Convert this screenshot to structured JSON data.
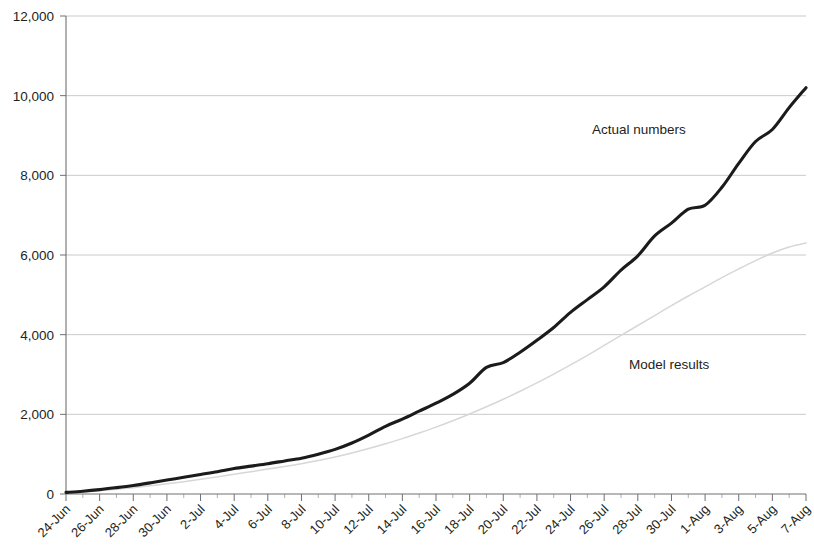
{
  "chart_data": {
    "type": "line",
    "title": "",
    "xlabel": "",
    "ylabel": "",
    "ylim": [
      0,
      12000
    ],
    "y_ticks": [
      0,
      2000,
      4000,
      6000,
      8000,
      10000,
      12000
    ],
    "y_tick_labels": [
      "0",
      "2,000",
      "4,000",
      "6,000",
      "8,000",
      "10,000",
      "12,000"
    ],
    "grid": true,
    "legend_position": "inline-annotations",
    "x": [
      "24-Jun",
      "25-Jun",
      "26-Jun",
      "27-Jun",
      "28-Jun",
      "29-Jun",
      "30-Jun",
      "1-Jul",
      "2-Jul",
      "3-Jul",
      "4-Jul",
      "5-Jul",
      "6-Jul",
      "7-Jul",
      "8-Jul",
      "9-Jul",
      "10-Jul",
      "11-Jul",
      "12-Jul",
      "13-Jul",
      "14-Jul",
      "15-Jul",
      "16-Jul",
      "17-Jul",
      "18-Jul",
      "19-Jul",
      "20-Jul",
      "21-Jul",
      "22-Jul",
      "23-Jul",
      "24-Jul",
      "25-Jul",
      "26-Jul",
      "27-Jul",
      "28-Jul",
      "29-Jul",
      "30-Jul",
      "31-Jul",
      "1-Aug",
      "2-Aug",
      "3-Aug",
      "4-Aug",
      "5-Aug",
      "6-Aug",
      "7-Aug"
    ],
    "x_tick_labels": [
      "24-Jun",
      "26-Jun",
      "28-Jun",
      "30-Jun",
      "2-Jul",
      "4-Jul",
      "6-Jul",
      "8-Jul",
      "10-Jul",
      "12-Jul",
      "14-Jul",
      "16-Jul",
      "18-Jul",
      "20-Jul",
      "22-Jul",
      "24-Jul",
      "26-Jul",
      "28-Jul",
      "30-Jul",
      "1-Aug",
      "3-Aug",
      "5-Aug",
      "7-Aug"
    ],
    "series": [
      {
        "name": "Actual numbers",
        "color": "#1b1b1b",
        "style": "solid-thick",
        "label_x": "1-Aug",
        "values": [
          40,
          70,
          110,
          160,
          215,
          280,
          350,
          420,
          490,
          560,
          640,
          700,
          760,
          830,
          900,
          1000,
          1120,
          1280,
          1480,
          1700,
          1880,
          2080,
          2280,
          2500,
          2780,
          3180,
          3300,
          3560,
          3860,
          4180,
          4560,
          4880,
          5200,
          5620,
          5980,
          6480,
          6800,
          7150,
          7250,
          7700,
          8300,
          8850,
          9150,
          9700,
          10200
        ]
      },
      {
        "name": "Model results",
        "color": "#d5d7d9",
        "style": "dotted-thin",
        "label_x": "29-Jul",
        "values": [
          30,
          55,
          85,
          120,
          160,
          205,
          255,
          310,
          370,
          430,
          495,
          560,
          625,
          690,
          760,
          840,
          930,
          1030,
          1140,
          1260,
          1390,
          1530,
          1680,
          1840,
          2010,
          2190,
          2380,
          2580,
          2790,
          3010,
          3240,
          3480,
          3730,
          3980,
          4230,
          4480,
          4730,
          4970,
          5200,
          5430,
          5650,
          5860,
          6050,
          6200,
          6300
        ]
      }
    ],
    "actual_full": [
      40,
      70,
      110,
      160,
      215,
      280,
      350,
      420,
      490,
      560,
      640,
      700,
      760,
      830,
      900,
      1000,
      1120,
      1280,
      1480,
      1700,
      1880,
      2080,
      2280,
      2500,
      2780,
      3180,
      3300,
      3560,
      3860,
      4180,
      4560,
      4880,
      5200,
      5620,
      5980,
      6480,
      6800,
      7150,
      7250,
      7700,
      8300,
      8850,
      9150,
      9700,
      10200
    ],
    "annotations": [
      {
        "text": "Actual numbers",
        "x_px": 592,
        "y_px": 134
      },
      {
        "text": "Model results",
        "x_px": 629,
        "y_px": 369
      }
    ]
  },
  "chart_meta": {
    "actual_label": "Actual numbers",
    "model_label": "Model results",
    "actual_color": "#1b1b1b",
    "model_color": "#d5d7d9",
    "grid_color": "#b9bcbe",
    "axis_color": "#6d7073",
    "background": "#ffffff"
  }
}
